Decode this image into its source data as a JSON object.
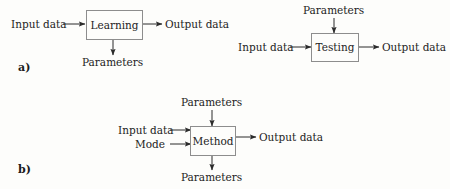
{
  "figure": {
    "background_color": "#fdfdfb",
    "line_color": "#2b2b2b",
    "box_border_color": "#8d8d8d",
    "text_color": "#232323"
  },
  "panels": [
    {
      "tag": "a)",
      "diagrams": [
        {
          "block_label": "Learning",
          "input_left": "Input data",
          "output_right": "Output data",
          "output_bottom": "Parameters"
        },
        {
          "block_label": "Testing",
          "input_top": "Parameters",
          "input_left": "Input data",
          "output_right": "Output data"
        }
      ]
    },
    {
      "tag": "b)",
      "diagrams": [
        {
          "block_label": "Method",
          "input_top": "Parameters",
          "input_left_1": "Input data",
          "input_left_2": "Mode",
          "output_right": "Output data",
          "output_bottom": "Parameters"
        }
      ]
    }
  ],
  "labels": {
    "panel_a_tag": "a)",
    "panel_b_tag": "b)",
    "learning_box": "Learning",
    "learning_input": "Input data",
    "learning_output": "Output data",
    "learning_parameters": "Parameters",
    "testing_parameters": "Parameters",
    "testing_input": "Input data",
    "testing_box": "Testing",
    "testing_output": "Output data",
    "method_parameters_top": "Parameters",
    "method_input": "Input data",
    "method_mode": "Mode",
    "method_box": "Method",
    "method_output": "Output data",
    "method_parameters_bottom": "Parameters"
  }
}
